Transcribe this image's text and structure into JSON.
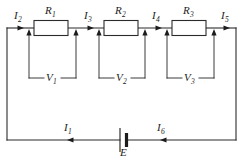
{
  "figure": {
    "kind": "series-circuit-schematic",
    "background_color": "#ffffff",
    "line_color": "#2b2b2b"
  },
  "components": {
    "resistors": [
      {
        "id": "R1",
        "base": "R",
        "sub": "1"
      },
      {
        "id": "R2",
        "base": "R",
        "sub": "2"
      },
      {
        "id": "R3",
        "base": "R",
        "sub": "3"
      }
    ],
    "voltages": [
      {
        "id": "V1",
        "base": "V",
        "sub": "1"
      },
      {
        "id": "V2",
        "base": "V",
        "sub": "2"
      },
      {
        "id": "V3",
        "base": "V",
        "sub": "3"
      }
    ],
    "source": {
      "id": "E",
      "base": "E",
      "sub": ""
    }
  },
  "currents": [
    {
      "id": "I1",
      "base": "I",
      "sub": "1",
      "direction": "left"
    },
    {
      "id": "I2",
      "base": "I",
      "sub": "2",
      "direction": "right"
    },
    {
      "id": "I3",
      "base": "I",
      "sub": "3",
      "direction": "right"
    },
    {
      "id": "I4",
      "base": "I",
      "sub": "4",
      "direction": "right"
    },
    {
      "id": "I5",
      "base": "I",
      "sub": "5",
      "direction": "right"
    },
    {
      "id": "I6",
      "base": "I",
      "sub": "6",
      "direction": "left"
    }
  ],
  "labels": {
    "R1": "R",
    "R1_sub": "1",
    "R2": "R",
    "R2_sub": "2",
    "R3": "R",
    "R3_sub": "3",
    "V1": "V",
    "V1_sub": "1",
    "V2": "V",
    "V2_sub": "2",
    "V3": "V",
    "V3_sub": "3",
    "I1": "I",
    "I1_sub": "1",
    "I2": "I",
    "I2_sub": "2",
    "I3": "I",
    "I3_sub": "3",
    "I4": "I",
    "I4_sub": "4",
    "I5": "I",
    "I5_sub": "5",
    "I6": "I",
    "I6_sub": "6",
    "E": "E"
  }
}
